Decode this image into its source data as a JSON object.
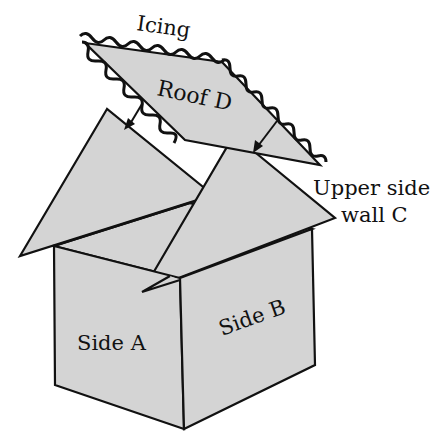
{
  "diagram": {
    "type": "exploded house / box assembly",
    "colors": {
      "fill": "#d4d4d4",
      "stroke": "#111111",
      "background": "#ffffff"
    },
    "labels": {
      "icing": "Icing",
      "roof": "Roof D",
      "upper_wall_line1": "Upper side",
      "upper_wall_line2": "wall C",
      "side_a": "Side A",
      "side_b": "Side B"
    }
  }
}
